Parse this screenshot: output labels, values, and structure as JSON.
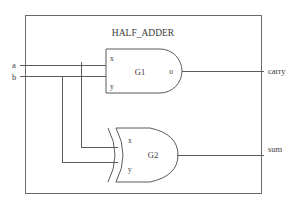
{
  "module": {
    "title": "HALF_ADDER",
    "border_color": "#6a6a6a",
    "wire_color": "#5b5b5b",
    "text_color": "#3a3a3a",
    "background": "#ffffff"
  },
  "inputs": [
    {
      "name": "a",
      "label": "a"
    },
    {
      "name": "b",
      "label": "b"
    }
  ],
  "outputs": [
    {
      "name": "carry",
      "label": "carry"
    },
    {
      "name": "sum",
      "label": "sum"
    }
  ],
  "gates": [
    {
      "id": "G1",
      "label": "G1",
      "type": "and",
      "pins": {
        "in_top": "x",
        "in_bottom": "y",
        "out": "o"
      }
    },
    {
      "id": "G2",
      "label": "G2",
      "type": "xor",
      "pins": {
        "in_top": "x",
        "in_bottom": "y",
        "out": ""
      }
    }
  ],
  "nets": [
    {
      "name": "a-to-G1-x"
    },
    {
      "name": "b-to-G1-y"
    },
    {
      "name": "a-to-G2-x"
    },
    {
      "name": "b-to-G2-y"
    },
    {
      "name": "G1-o-to-carry"
    },
    {
      "name": "G2-out-to-sum"
    }
  ]
}
